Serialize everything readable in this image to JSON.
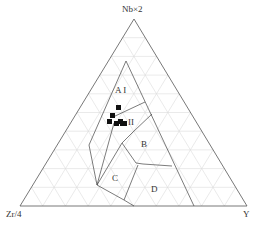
{
  "chart_data": {
    "type": "ternary",
    "title": "",
    "axes": {
      "top": "Nb×2",
      "left": "Zr/4",
      "right": "Y"
    },
    "grid": true,
    "grid_step": 0.1,
    "regions": [
      {
        "label": "A I"
      },
      {
        "label": "II"
      },
      {
        "label": "B"
      },
      {
        "label": "C"
      },
      {
        "label": "D"
      }
    ],
    "points": [
      {
        "x": 118.5,
        "y": 107.5
      },
      {
        "x": 112.5,
        "y": 115.5
      },
      {
        "x": 109.5,
        "y": 121.5
      },
      {
        "x": 116.5,
        "y": 123.5
      },
      {
        "x": 120.5,
        "y": 121.5
      },
      {
        "x": 122.5,
        "y": 123.5
      },
      {
        "x": 124.5,
        "y": 123.5
      }
    ],
    "marker": "filled-square",
    "colors": {
      "line": "#555555",
      "grid": "#d8d8d8",
      "marker": "#111111"
    }
  },
  "labels": {
    "top": "Nb×2",
    "left": "Zr/4",
    "right": "Y",
    "regionA": "A I",
    "regionII": "II",
    "regionB": "B",
    "regionC": "C",
    "regionD": "D"
  }
}
